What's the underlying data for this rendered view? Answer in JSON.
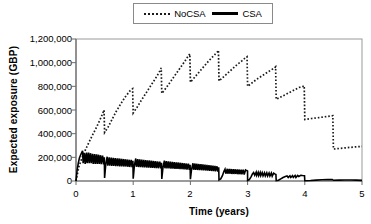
{
  "chart_data": {
    "type": "line",
    "title": "",
    "xlabel": "Time (years)",
    "ylabel": "Expected exposure (GBP)",
    "xlim": [
      0,
      5
    ],
    "ylim": [
      0,
      1200000
    ],
    "xticks": [
      0,
      1,
      2,
      3,
      4,
      5
    ],
    "xtick_labels": [
      "0",
      "1",
      "2",
      "3",
      "4",
      "5"
    ],
    "yticks": [
      0,
      200000,
      400000,
      600000,
      800000,
      1000000,
      1200000
    ],
    "ytick_labels": [
      "0",
      "200,000",
      "400,000",
      "600,000",
      "800,000",
      "1,000,000",
      "1,200,000"
    ],
    "grid": false,
    "legend_position": "top-center",
    "series": [
      {
        "name": "NoCSA",
        "style": "dotted",
        "color": "#1a1a1a",
        "points": [
          [
            0.0,
            0
          ],
          [
            0.05,
            120000
          ],
          [
            0.12,
            215000
          ],
          [
            0.2,
            300000
          ],
          [
            0.28,
            380000
          ],
          [
            0.36,
            455000
          ],
          [
            0.44,
            540000
          ],
          [
            0.49,
            600000
          ],
          [
            0.5,
            410000
          ],
          [
            0.56,
            455000
          ],
          [
            0.63,
            520000
          ],
          [
            0.7,
            585000
          ],
          [
            0.78,
            650000
          ],
          [
            0.86,
            710000
          ],
          [
            0.94,
            760000
          ],
          [
            0.99,
            780000
          ],
          [
            1.0,
            575000
          ],
          [
            1.07,
            625000
          ],
          [
            1.14,
            680000
          ],
          [
            1.22,
            740000
          ],
          [
            1.3,
            800000
          ],
          [
            1.38,
            860000
          ],
          [
            1.45,
            915000
          ],
          [
            1.49,
            955000
          ],
          [
            1.5,
            740000
          ],
          [
            1.58,
            790000
          ],
          [
            1.66,
            845000
          ],
          [
            1.74,
            900000
          ],
          [
            1.82,
            955000
          ],
          [
            1.9,
            1010000
          ],
          [
            1.96,
            1055000
          ],
          [
            1.99,
            1075000
          ],
          [
            2.0,
            835000
          ],
          [
            2.08,
            880000
          ],
          [
            2.16,
            925000
          ],
          [
            2.24,
            970000
          ],
          [
            2.32,
            1015000
          ],
          [
            2.4,
            1055000
          ],
          [
            2.47,
            1090000
          ],
          [
            2.49,
            1105000
          ],
          [
            2.5,
            845000
          ],
          [
            2.58,
            880000
          ],
          [
            2.66,
            915000
          ],
          [
            2.74,
            950000
          ],
          [
            2.82,
            985000
          ],
          [
            2.9,
            1015000
          ],
          [
            2.97,
            1045000
          ],
          [
            2.99,
            1050000
          ],
          [
            3.0,
            800000
          ],
          [
            3.08,
            830000
          ],
          [
            3.16,
            860000
          ],
          [
            3.24,
            885000
          ],
          [
            3.32,
            910000
          ],
          [
            3.4,
            935000
          ],
          [
            3.47,
            955000
          ],
          [
            3.49,
            965000
          ],
          [
            3.5,
            690000
          ],
          [
            3.58,
            710000
          ],
          [
            3.66,
            730000
          ],
          [
            3.74,
            750000
          ],
          [
            3.82,
            770000
          ],
          [
            3.9,
            790000
          ],
          [
            3.97,
            800000
          ],
          [
            3.99,
            805000
          ],
          [
            4.0,
            520000
          ],
          [
            4.12,
            528000
          ],
          [
            4.25,
            536000
          ],
          [
            4.38,
            545000
          ],
          [
            4.49,
            552000
          ],
          [
            4.5,
            270000
          ],
          [
            4.62,
            276000
          ],
          [
            4.75,
            282000
          ],
          [
            4.88,
            288000
          ],
          [
            5.0,
            292000
          ]
        ]
      },
      {
        "name": "CSA",
        "style": "solid",
        "color": "#000000",
        "points": [
          [
            0.0,
            0
          ],
          [
            0.02,
            95000
          ],
          [
            0.04,
            150000
          ],
          [
            0.06,
            195000
          ],
          [
            0.08,
            220000
          ],
          [
            0.1,
            240000
          ],
          [
            0.115,
            255000
          ],
          [
            0.125,
            150000
          ],
          [
            0.15,
            235000
          ],
          [
            0.16,
            145000
          ],
          [
            0.185,
            240000
          ],
          [
            0.195,
            150000
          ],
          [
            0.22,
            240000
          ],
          [
            0.23,
            150000
          ],
          [
            0.255,
            235000
          ],
          [
            0.265,
            150000
          ],
          [
            0.29,
            230000
          ],
          [
            0.3,
            145000
          ],
          [
            0.325,
            228000
          ],
          [
            0.335,
            145000
          ],
          [
            0.36,
            225000
          ],
          [
            0.37,
            145000
          ],
          [
            0.395,
            222000
          ],
          [
            0.405,
            145000
          ],
          [
            0.43,
            218000
          ],
          [
            0.44,
            142000
          ],
          [
            0.465,
            215000
          ],
          [
            0.48,
            140000
          ],
          [
            0.495,
            200000
          ],
          [
            0.5,
            25000
          ],
          [
            0.52,
            140000
          ],
          [
            0.545,
            205000
          ],
          [
            0.555,
            130000
          ],
          [
            0.58,
            200000
          ],
          [
            0.59,
            130000
          ],
          [
            0.615,
            198000
          ],
          [
            0.625,
            128000
          ],
          [
            0.65,
            196000
          ],
          [
            0.66,
            128000
          ],
          [
            0.685,
            194000
          ],
          [
            0.695,
            126000
          ],
          [
            0.72,
            192000
          ],
          [
            0.73,
            126000
          ],
          [
            0.755,
            190000
          ],
          [
            0.765,
            124000
          ],
          [
            0.79,
            188000
          ],
          [
            0.8,
            124000
          ],
          [
            0.825,
            186000
          ],
          [
            0.835,
            122000
          ],
          [
            0.86,
            184000
          ],
          [
            0.87,
            122000
          ],
          [
            0.895,
            182000
          ],
          [
            0.905,
            120000
          ],
          [
            0.93,
            180000
          ],
          [
            0.94,
            118000
          ],
          [
            0.965,
            178000
          ],
          [
            0.98,
            116000
          ],
          [
            0.995,
            170000
          ],
          [
            1.0,
            20000
          ],
          [
            1.02,
            128000
          ],
          [
            1.045,
            190000
          ],
          [
            1.055,
            120000
          ],
          [
            1.08,
            185000
          ],
          [
            1.09,
            118000
          ],
          [
            1.115,
            183000
          ],
          [
            1.125,
            117000
          ],
          [
            1.15,
            181000
          ],
          [
            1.16,
            116000
          ],
          [
            1.185,
            179000
          ],
          [
            1.195,
            115000
          ],
          [
            1.22,
            177000
          ],
          [
            1.23,
            114000
          ],
          [
            1.255,
            175000
          ],
          [
            1.265,
            113000
          ],
          [
            1.29,
            173000
          ],
          [
            1.3,
            112000
          ],
          [
            1.325,
            171000
          ],
          [
            1.335,
            111000
          ],
          [
            1.36,
            169000
          ],
          [
            1.37,
            110000
          ],
          [
            1.395,
            167000
          ],
          [
            1.405,
            109000
          ],
          [
            1.43,
            165000
          ],
          [
            1.44,
            108000
          ],
          [
            1.465,
            163000
          ],
          [
            1.48,
            106000
          ],
          [
            1.495,
            155000
          ],
          [
            1.5,
            18000
          ],
          [
            1.52,
            112000
          ],
          [
            1.545,
            172000
          ],
          [
            1.555,
            108000
          ],
          [
            1.58,
            168000
          ],
          [
            1.59,
            107000
          ],
          [
            1.615,
            166000
          ],
          [
            1.625,
            106000
          ],
          [
            1.65,
            164000
          ],
          [
            1.66,
            105000
          ],
          [
            1.685,
            162000
          ],
          [
            1.695,
            104000
          ],
          [
            1.72,
            160000
          ],
          [
            1.73,
            103000
          ],
          [
            1.755,
            158000
          ],
          [
            1.765,
            102000
          ],
          [
            1.79,
            156000
          ],
          [
            1.8,
            101000
          ],
          [
            1.825,
            154000
          ],
          [
            1.835,
            100000
          ],
          [
            1.86,
            152000
          ],
          [
            1.87,
            99000
          ],
          [
            1.895,
            150000
          ],
          [
            1.905,
            98000
          ],
          [
            1.93,
            148000
          ],
          [
            1.94,
            96000
          ],
          [
            1.965,
            146000
          ],
          [
            1.98,
            94000
          ],
          [
            1.995,
            138000
          ],
          [
            2.0,
            15000
          ],
          [
            2.02,
            98000
          ],
          [
            2.045,
            150000
          ],
          [
            2.055,
            95000
          ],
          [
            2.08,
            148000
          ],
          [
            2.09,
            94000
          ],
          [
            2.115,
            146000
          ],
          [
            2.125,
            93000
          ],
          [
            2.15,
            144000
          ],
          [
            2.16,
            92000
          ],
          [
            2.185,
            142000
          ],
          [
            2.195,
            91000
          ],
          [
            2.22,
            140000
          ],
          [
            2.23,
            90000
          ],
          [
            2.255,
            138000
          ],
          [
            2.265,
            89000
          ],
          [
            2.29,
            136000
          ],
          [
            2.3,
            88000
          ],
          [
            2.325,
            134000
          ],
          [
            2.335,
            86000
          ],
          [
            2.36,
            132000
          ],
          [
            2.37,
            85000
          ],
          [
            2.395,
            130000
          ],
          [
            2.405,
            84000
          ],
          [
            2.43,
            128000
          ],
          [
            2.44,
            82000
          ],
          [
            2.465,
            124000
          ],
          [
            2.48,
            80000
          ],
          [
            2.495,
            115000
          ],
          [
            2.5,
            10000
          ],
          [
            2.53,
            18000
          ],
          [
            2.56,
            45000
          ],
          [
            2.585,
            80000
          ],
          [
            2.605,
            100000
          ],
          [
            2.62,
            62000
          ],
          [
            2.645,
            103000
          ],
          [
            2.655,
            62000
          ],
          [
            2.68,
            102000
          ],
          [
            2.69,
            61000
          ],
          [
            2.715,
            101000
          ],
          [
            2.725,
            60000
          ],
          [
            2.75,
            100000
          ],
          [
            2.76,
            60000
          ],
          [
            2.785,
            99000
          ],
          [
            2.795,
            59000
          ],
          [
            2.82,
            98000
          ],
          [
            2.83,
            58000
          ],
          [
            2.855,
            97000
          ],
          [
            2.865,
            57000
          ],
          [
            2.89,
            96000
          ],
          [
            2.9,
            56000
          ],
          [
            2.925,
            95000
          ],
          [
            2.94,
            55000
          ],
          [
            2.965,
            93000
          ],
          [
            2.985,
            88000
          ],
          [
            2.999,
            85000
          ],
          [
            3.0,
            5000
          ],
          [
            3.03,
            12000
          ],
          [
            3.06,
            35000
          ],
          [
            3.085,
            60000
          ],
          [
            3.105,
            72000
          ],
          [
            3.125,
            48000
          ],
          [
            3.15,
            74000
          ],
          [
            3.16,
            47000
          ],
          [
            3.185,
            73000
          ],
          [
            3.195,
            46000
          ],
          [
            3.22,
            72000
          ],
          [
            3.23,
            45000
          ],
          [
            3.255,
            71000
          ],
          [
            3.27,
            44000
          ],
          [
            3.295,
            70000
          ],
          [
            3.31,
            43000
          ],
          [
            3.335,
            69000
          ],
          [
            3.35,
            42000
          ],
          [
            3.375,
            68000
          ],
          [
            3.39,
            42000
          ],
          [
            3.415,
            67000
          ],
          [
            3.43,
            41000
          ],
          [
            3.455,
            66000
          ],
          [
            3.475,
            60000
          ],
          [
            3.495,
            55000
          ],
          [
            3.5,
            3000
          ],
          [
            3.54,
            6000
          ],
          [
            3.58,
            18000
          ],
          [
            3.62,
            30000
          ],
          [
            3.66,
            38000
          ],
          [
            3.69,
            42000
          ],
          [
            3.71,
            30000
          ],
          [
            3.74,
            44000
          ],
          [
            3.755,
            30000
          ],
          [
            3.785,
            45000
          ],
          [
            3.8,
            30000
          ],
          [
            3.83,
            46000
          ],
          [
            3.845,
            30000
          ],
          [
            3.875,
            47000
          ],
          [
            3.895,
            38000
          ],
          [
            3.93,
            48000
          ],
          [
            3.96,
            46000
          ],
          [
            3.995,
            44000
          ],
          [
            4.0,
            2000
          ],
          [
            4.1,
            4000
          ],
          [
            4.2,
            7000
          ],
          [
            4.3,
            10000
          ],
          [
            4.4,
            12000
          ],
          [
            4.48,
            13000
          ],
          [
            4.5,
            6000
          ],
          [
            4.6,
            7000
          ],
          [
            4.7,
            8000
          ],
          [
            4.8,
            8000
          ],
          [
            4.9,
            7000
          ],
          [
            5.0,
            5000
          ]
        ]
      }
    ]
  },
  "legend": {
    "items": [
      {
        "label": "NoCSA",
        "style": "dotted"
      },
      {
        "label": "CSA",
        "style": "solid"
      }
    ]
  },
  "axes": {
    "x_title": "Time (years)",
    "y_title": "Expected exposure (GBP)"
  }
}
